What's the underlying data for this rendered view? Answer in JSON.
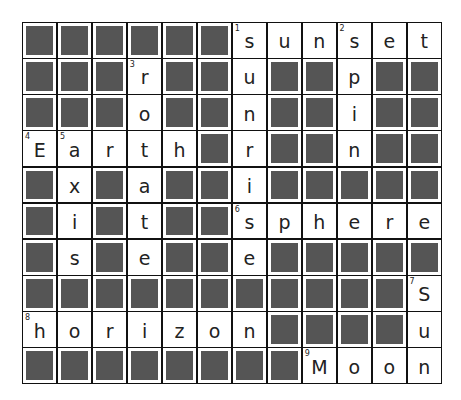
{
  "puzzle": {
    "columns": 12,
    "rows": 10,
    "block_color": "#555555",
    "grid": [
      [
        "#",
        "#",
        "#",
        "#",
        "#",
        "#",
        "s",
        "u",
        "n",
        "s",
        "e",
        "t"
      ],
      [
        "#",
        "#",
        "#",
        "r",
        "#",
        "#",
        "u",
        "#",
        "#",
        "p",
        "#",
        "#"
      ],
      [
        "#",
        "#",
        "#",
        "o",
        "#",
        "#",
        "n",
        "#",
        "#",
        "i",
        "#",
        "#"
      ],
      [
        "E",
        "a",
        "r",
        "t",
        "h",
        "#",
        "r",
        "#",
        "#",
        "n",
        "#",
        "#"
      ],
      [
        "#",
        "x",
        "#",
        "a",
        "#",
        "#",
        "i",
        "#",
        "#",
        "#",
        "#",
        "#"
      ],
      [
        "#",
        "i",
        "#",
        "t",
        "#",
        "#",
        "s",
        "p",
        "h",
        "e",
        "r",
        "e"
      ],
      [
        "#",
        "s",
        "#",
        "e",
        "#",
        "#",
        "e",
        "#",
        "#",
        "#",
        "#",
        "#"
      ],
      [
        "#",
        "#",
        "#",
        "#",
        "#",
        "#",
        "#",
        "#",
        "#",
        "#",
        "#",
        "S"
      ],
      [
        "h",
        "o",
        "r",
        "i",
        "z",
        "o",
        "n",
        "#",
        "#",
        "#",
        "#",
        "u"
      ],
      [
        "#",
        "#",
        "#",
        "#",
        "#",
        "#",
        "#",
        "#",
        "M",
        "o",
        "o",
        "n"
      ]
    ],
    "numbers": [
      {
        "row": 0,
        "col": 6,
        "n": "1"
      },
      {
        "row": 0,
        "col": 9,
        "n": "2"
      },
      {
        "row": 1,
        "col": 3,
        "n": "3"
      },
      {
        "row": 3,
        "col": 0,
        "n": "4"
      },
      {
        "row": 3,
        "col": 1,
        "n": "5"
      },
      {
        "row": 5,
        "col": 6,
        "n": "6"
      },
      {
        "row": 7,
        "col": 11,
        "n": "7"
      },
      {
        "row": 8,
        "col": 0,
        "n": "8"
      },
      {
        "row": 9,
        "col": 8,
        "n": "9"
      }
    ],
    "words": {
      "across": [
        {
          "n": "1",
          "answer": "sunset"
        },
        {
          "n": "4",
          "answer": "Earth"
        },
        {
          "n": "6",
          "answer": "sphere"
        },
        {
          "n": "8",
          "answer": "horizon"
        },
        {
          "n": "9",
          "answer": "Moon"
        }
      ],
      "down": [
        {
          "n": "1",
          "answer": "sunrise"
        },
        {
          "n": "2",
          "answer": "spin"
        },
        {
          "n": "3",
          "answer": "rotate"
        },
        {
          "n": "5",
          "answer": "axis"
        },
        {
          "n": "7",
          "answer": "Sun"
        }
      ]
    }
  }
}
